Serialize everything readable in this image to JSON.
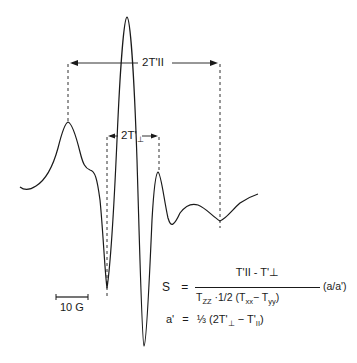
{
  "figure": {
    "type": "EPR spectrum (spin-label) with measurement annotations",
    "annotations": {
      "parallel_splitting_label": "2T'II",
      "perpendicular_splitting_label": "2T'",
      "perpendicular_symbol": "⊥",
      "scale_bar_label": "10 G"
    },
    "equations": {
      "order_parameter": {
        "lhs": "S",
        "equals": "=",
        "numerator": "T'II - T'⊥",
        "denominator_parts": {
          "tzz": "T",
          "tzz_sub": "ZZ",
          "mid": "·1/2 (T",
          "txx_sub": "xx",
          "minus": "− T",
          "tyy_sub": "yy",
          "close": ")"
        },
        "factor": "(a/a')"
      },
      "isotropic": {
        "lhs": "a'",
        "equals": "=",
        "rhs_open": "⅓ (2T'",
        "perp_sub": "⊥",
        "rhs_mid": "− T'",
        "par_sub": "II",
        "rhs_close": ")"
      }
    },
    "colors": {
      "line": "#1a1a1a",
      "background": "#ffffff"
    }
  }
}
